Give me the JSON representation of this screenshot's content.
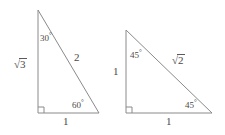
{
  "figure": {
    "width": 225,
    "height": 135,
    "background": "#ffffff",
    "stroke_color": "#8a8a8a",
    "text_color": "#4a4a4a",
    "stroke_width": 1
  },
  "triangles": [
    {
      "name": "30-60-90-triangle",
      "vertices": {
        "apex": [
          38,
          10
        ],
        "right_angle": [
          38,
          113
        ],
        "base_right": [
          99,
          113
        ]
      },
      "right_angle_marker": true,
      "labels": {
        "vertical_leg": "√3",
        "vertical_leg_plain": "sqrt(3)",
        "hypotenuse": "2",
        "base": "1",
        "apex_angle": "30",
        "base_right_angle": "60",
        "degree_symbol": "°"
      }
    },
    {
      "name": "45-45-90-triangle",
      "vertices": {
        "apex": [
          126,
          30
        ],
        "right_angle": [
          126,
          113
        ],
        "base_right": [
          212,
          113
        ]
      },
      "right_angle_marker": true,
      "labels": {
        "vertical_leg": "1",
        "hypotenuse": "√2",
        "hypotenuse_plain": "sqrt(2)",
        "base": "1",
        "apex_angle": "45",
        "base_right_angle": "45",
        "degree_symbol": "°"
      }
    }
  ],
  "text_items": [
    {
      "name": "left-vertical-leg-label",
      "text": "3",
      "radical": true,
      "x": 14,
      "y": 58,
      "size": "side"
    },
    {
      "name": "left-hypotenuse-label",
      "text": "2",
      "radical": false,
      "x": 74,
      "y": 52,
      "size": "side"
    },
    {
      "name": "left-base-label",
      "text": "1",
      "radical": false,
      "x": 63,
      "y": 116,
      "size": "side"
    },
    {
      "name": "left-apex-angle-label",
      "text": "30",
      "radical": false,
      "x": 40,
      "y": 32,
      "size": "angle",
      "degree": true
    },
    {
      "name": "left-base-angle-label",
      "text": "60",
      "radical": false,
      "x": 72,
      "y": 99,
      "size": "angle",
      "degree": true
    },
    {
      "name": "right-vertical-leg-label",
      "text": "1",
      "radical": false,
      "x": 113,
      "y": 66,
      "size": "side"
    },
    {
      "name": "right-hypotenuse-label",
      "text": "2",
      "radical": true,
      "x": 172,
      "y": 54,
      "size": "side"
    },
    {
      "name": "right-base-label",
      "text": "1",
      "radical": false,
      "x": 166,
      "y": 116,
      "size": "side"
    },
    {
      "name": "right-apex-angle-label",
      "text": "45",
      "radical": false,
      "x": 130,
      "y": 49,
      "size": "angle",
      "degree": true
    },
    {
      "name": "right-base-angle-label",
      "text": "45",
      "radical": false,
      "x": 185,
      "y": 99,
      "size": "angle",
      "degree": true
    }
  ]
}
